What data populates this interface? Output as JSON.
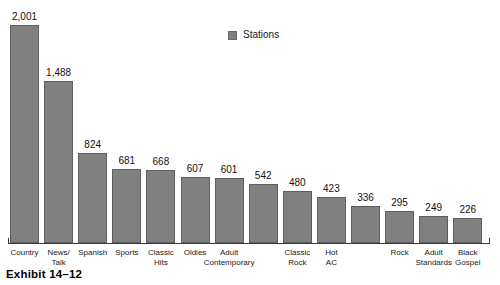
{
  "caption": "Exhibit 14–12",
  "legend": {
    "label": "Stations",
    "swatch_color": "#808080"
  },
  "chart_data": {
    "type": "bar",
    "title": "",
    "xlabel": "",
    "ylabel": "",
    "ylim": [
      0,
      2001
    ],
    "grid": false,
    "legend_position": "top-center",
    "series": [
      {
        "name": "Stations",
        "color": "#808080",
        "values": [
          2001,
          1488,
          824,
          681,
          668,
          607,
          601,
          542,
          480,
          423,
          336,
          295,
          249,
          226
        ]
      }
    ],
    "categories": [
      "Country",
      "News/\nTalk",
      "Spanish",
      "Sports",
      "Classic\nHits",
      "Oldies",
      "Adult\nContemporary",
      "",
      "Classic\nRock",
      "Hot\nAC",
      "",
      "Rock",
      "Adult\nStandards",
      "Black\nGospel"
    ],
    "value_labels": [
      "2,001",
      "1,488",
      "824",
      "681",
      "668",
      "607",
      "601",
      "542",
      "480",
      "423",
      "336",
      "295",
      "249",
      "226"
    ]
  },
  "bars": [
    {
      "label_line1": "Country",
      "label_line2": "",
      "value_label": "2,001",
      "value": 2001
    },
    {
      "label_line1": "News/",
      "label_line2": "Talk",
      "value_label": "1,488",
      "value": 1488
    },
    {
      "label_line1": "Spanish",
      "label_line2": "",
      "value_label": "824",
      "value": 824
    },
    {
      "label_line1": "Sports",
      "label_line2": "",
      "value_label": "681",
      "value": 681
    },
    {
      "label_line1": "Classic",
      "label_line2": "Hits",
      "value_label": "668",
      "value": 668
    },
    {
      "label_line1": "Oldies",
      "label_line2": "",
      "value_label": "607",
      "value": 607
    },
    {
      "label_line1": "Adult",
      "label_line2": "Contemporary",
      "value_label": "601",
      "value": 601
    },
    {
      "label_line1": "",
      "label_line2": "",
      "value_label": "542",
      "value": 542
    },
    {
      "label_line1": "Classic",
      "label_line2": "Rock",
      "value_label": "480",
      "value": 480
    },
    {
      "label_line1": "Hot",
      "label_line2": "AC",
      "value_label": "423",
      "value": 423
    },
    {
      "label_line1": "",
      "label_line2": "",
      "value_label": "336",
      "value": 336
    },
    {
      "label_line1": "Rock",
      "label_line2": "",
      "value_label": "295",
      "value": 295
    },
    {
      "label_line1": "Adult",
      "label_line2": "Standards",
      "value_label": "249",
      "value": 249
    },
    {
      "label_line1": "Black",
      "label_line2": "Gospel",
      "value_label": "226",
      "value": 226
    }
  ]
}
